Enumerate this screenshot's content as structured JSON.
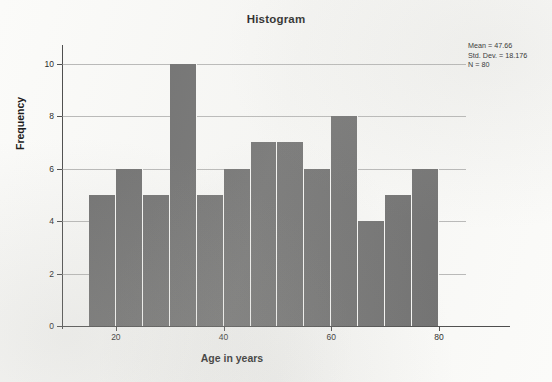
{
  "chart_data": {
    "type": "bar",
    "title": "Histogram",
    "xlabel": "Age in years",
    "ylabel": "Frequency",
    "categories": [
      "15-20",
      "20-25",
      "25-30",
      "30-35",
      "35-40",
      "40-45",
      "45-50",
      "50-55",
      "55-60",
      "60-65",
      "65-70",
      "70-75",
      "75-80"
    ],
    "bin_centers": [
      17.5,
      22.5,
      27.5,
      32.5,
      37.5,
      42.5,
      47.5,
      52.5,
      57.5,
      62.5,
      67.5,
      72.5,
      77.5
    ],
    "bin_edges": [
      15,
      20,
      25,
      30,
      35,
      40,
      45,
      50,
      55,
      60,
      65,
      70,
      75,
      80
    ],
    "values": [
      5,
      6,
      5,
      10,
      5,
      6,
      7,
      7,
      6,
      8,
      4,
      5,
      6
    ],
    "xlim": [
      10,
      85
    ],
    "ylim": [
      0,
      10.6
    ],
    "x_ticks": [
      20,
      40,
      60,
      80
    ],
    "y_ticks": [
      0,
      2,
      4,
      6,
      8,
      10
    ],
    "grid": "horizontal",
    "legend": "none",
    "bar_color": "#6d6d6d",
    "background_color": "#fbfbf9"
  },
  "stats": {
    "mean": "Mean = 47.66",
    "std_dev": "Std. Dev. = 18.176",
    "n": "N = 80"
  }
}
